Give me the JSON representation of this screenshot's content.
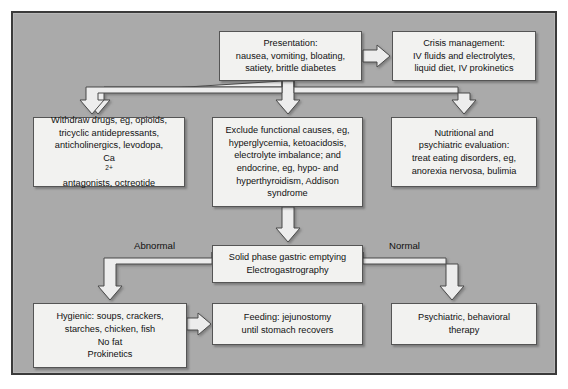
{
  "diagram": {
    "background_color": "#aaaaaa",
    "node_fill": "#f2f2f0",
    "node_border": "#555555",
    "frame_border": "#3a3a3a",
    "connector_fill": "#ededed",
    "connector_stroke": "#4a4a4a"
  },
  "nodes": {
    "presentation": {
      "name": "Presentation",
      "lines": [
        "Presentation:",
        "nausea, vomiting, bloating,",
        "satiety, brittle diabetes"
      ]
    },
    "crisis": {
      "name": "Crisis management",
      "lines": [
        "Crisis management:",
        "IV fluids and electrolytes,",
        "liquid diet, IV prokinetics"
      ]
    },
    "withdraw": {
      "name": "Withdraw drugs",
      "lines": [
        "Withdraw drugs, eg, opioids,",
        "tricyclic antidepressants,",
        "anticholinergics, levodopa,",
        "Ca2+ antagonists, octreotide"
      ],
      "line4_prefix": "Ca",
      "line4_super": "2+",
      "line4_suffix": " antagonists, octreotide"
    },
    "exclude": {
      "name": "Exclude functional causes",
      "lines": [
        "Exclude functional causes, eg,",
        "hyperglycemia, ketoacidosis,",
        "electrolyte imbalance; and",
        "endocrine, eg, hypo- and",
        "hyperthyroidism, Addison",
        "syndrome"
      ]
    },
    "nutritional": {
      "name": "Nutritional and psychiatric evaluation",
      "lines": [
        "Nutritional and",
        "psychiatric evaluation:",
        "treat eating disorders, eg,",
        "anorexia nervosa, bulimia"
      ]
    },
    "gastric": {
      "name": "Solid phase gastric emptying",
      "lines": [
        "Solid phase gastric emptying",
        "Electrogastrography"
      ]
    },
    "hygienic": {
      "name": "Hygienic diet",
      "lines": [
        "Hygienic: soups, crackers,",
        "starches, chicken, fish",
        "No fat",
        "Prokinetics"
      ]
    },
    "feeding": {
      "name": "Feeding jejunostomy",
      "lines": [
        "Feeding: jejunostomy",
        "until stomach recovers"
      ]
    },
    "psychiatric": {
      "name": "Psychiatric behavioral therapy",
      "lines": [
        "Psychiatric, behavioral",
        "therapy"
      ]
    }
  },
  "branch_labels": {
    "abnormal": "Abnormal",
    "normal": "Normal"
  },
  "connectors": [
    {
      "id": "presentation-to-crisis",
      "type": "arrow-right"
    },
    {
      "id": "presentation-to-withdraw",
      "type": "elbow-arrow-down-left"
    },
    {
      "id": "presentation-to-exclude",
      "type": "arrow-down"
    },
    {
      "id": "presentation-to-nutritional",
      "type": "elbow-arrow-down-right"
    },
    {
      "id": "exclude-to-gastric",
      "type": "arrow-down"
    },
    {
      "id": "gastric-to-hygienic",
      "type": "elbow-arrow-down-left"
    },
    {
      "id": "gastric-to-psychiatric",
      "type": "elbow-arrow-down-right"
    },
    {
      "id": "hygienic-to-feeding",
      "type": "arrow-right"
    }
  ]
}
